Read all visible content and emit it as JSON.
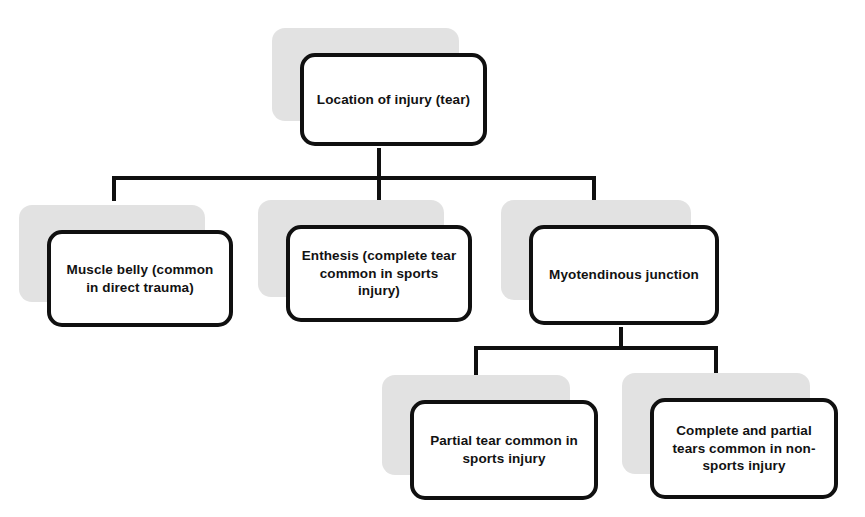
{
  "diagram": {
    "type": "flowchart",
    "title": "Location of injury (tear)",
    "orientation": "top-down",
    "colors": {
      "node_fill": "#ffffff",
      "node_border": "#101010",
      "node_shadow": "#e2e2e2",
      "connector": "#101010",
      "background": "#ffffff",
      "text": "#121212"
    },
    "nodes": [
      {
        "id": "root",
        "label": "Location of injury (tear)",
        "level": 0
      },
      {
        "id": "muscle-belly",
        "label": "Muscle belly (common in direct trauma)",
        "level": 1
      },
      {
        "id": "enthesis",
        "label": "Enthesis (complete tear common in sports injury)",
        "level": 1
      },
      {
        "id": "myotendinous-junction",
        "label": "Myotendinous junction",
        "level": 1
      },
      {
        "id": "partial-tear",
        "label": "Partial tear common in sports injury",
        "level": 2
      },
      {
        "id": "complete-partial-tears",
        "label": "Complete and partial tears common in non-sports injury",
        "level": 2
      }
    ],
    "edges": [
      {
        "from": "root",
        "to": "muscle-belly"
      },
      {
        "from": "root",
        "to": "enthesis"
      },
      {
        "from": "root",
        "to": "myotendinous-junction"
      },
      {
        "from": "myotendinous-junction",
        "to": "partial-tear"
      },
      {
        "from": "myotendinous-junction",
        "to": "complete-partial-tears"
      }
    ]
  },
  "page": {
    "caption_fragment": ""
  }
}
